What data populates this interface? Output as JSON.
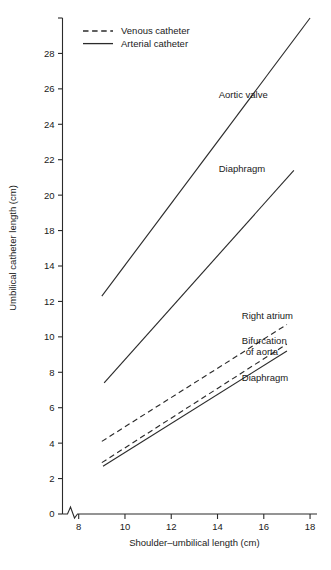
{
  "chart_data": {
    "type": "line",
    "title": "",
    "xlabel": "Shoulder–umbilical length (cm)",
    "ylabel": "Umbilical catheter length (cm)",
    "xlim": [
      7.3,
      18.3
    ],
    "ylim": [
      0,
      28
    ],
    "grid": false,
    "axis_break": true,
    "legend_position": "top-left",
    "xticks": [
      8,
      10,
      12,
      14,
      16,
      18
    ],
    "xtick_labels": [
      "8",
      "10",
      "12",
      "14",
      "16",
      "18"
    ],
    "yticks": [
      0,
      2,
      4,
      6,
      8,
      10,
      12,
      14,
      16,
      18,
      20,
      22,
      24,
      26,
      28
    ],
    "ytick_labels": [
      "0",
      "2",
      "4",
      "6",
      "8",
      "10",
      "12",
      "14",
      "18",
      "20",
      "22",
      "24",
      "26",
      "28"
    ],
    "legend": [
      {
        "name": "Venous catheter",
        "style": "dashed"
      },
      {
        "name": "Arterial catheter",
        "style": "solid"
      }
    ],
    "series": [
      {
        "name": "Aortic valve",
        "catheter": "Arterial catheter",
        "style": "solid",
        "x": [
          9.0,
          18.0
        ],
        "y": [
          12.3,
          28.0
        ],
        "label": "Aortic valve",
        "label_x": 14.05,
        "label_y": 23.5
      },
      {
        "name": "Diaphragm (arterial)",
        "catheter": "Arterial catheter",
        "style": "solid",
        "x": [
          9.1,
          17.3
        ],
        "y": [
          7.4,
          19.4
        ],
        "label": "Diaphragm",
        "label_x": 14.05,
        "label_y": 19.3
      },
      {
        "name": "Right atrium",
        "catheter": "Venous catheter",
        "style": "dashed",
        "x": [
          9.0,
          17.0
        ],
        "y": [
          4.1,
          10.7
        ],
        "label": "Right atrium",
        "label_x": 15.05,
        "label_y": 11.0
      },
      {
        "name": "Bifurcation of aorta",
        "catheter": "Venous catheter",
        "style": "dashed",
        "x": [
          9.0,
          17.0
        ],
        "y": [
          2.9,
          9.6
        ],
        "label": "Bifurcation",
        "label_line2": "of aorta",
        "label_x": 15.05,
        "label_y": 9.6
      },
      {
        "name": "Diaphragm (venous)",
        "catheter": "Arterial catheter",
        "style": "solid",
        "x": [
          9.05,
          17.0
        ],
        "y": [
          2.7,
          9.2
        ],
        "label": "Diaphragm",
        "label_x": 15.05,
        "label_y": 7.5
      }
    ]
  }
}
